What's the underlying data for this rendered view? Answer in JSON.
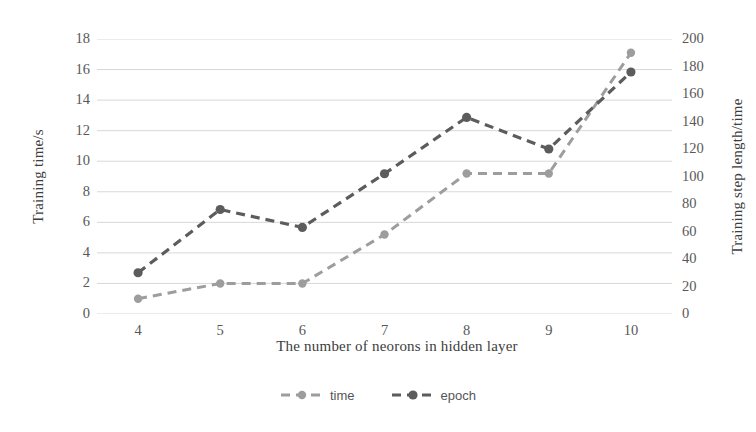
{
  "chart_data": {
    "type": "line",
    "title": "",
    "xlabel": "The number of neorons in hidden layer",
    "ylabel": "Training time/s",
    "ylabel_secondary": "Training step length/time",
    "categories": [
      "4",
      "5",
      "6",
      "7",
      "8",
      "9",
      "10"
    ],
    "x": [
      4,
      5,
      6,
      7,
      8,
      9,
      10
    ],
    "xlim": [
      3.5,
      10.5
    ],
    "ylim": [
      0,
      18
    ],
    "ylim_secondary": [
      0,
      200
    ],
    "yticks": [
      "0",
      "2",
      "4",
      "6",
      "8",
      "10",
      "12",
      "14",
      "16",
      "18"
    ],
    "yticks_secondary": [
      "0",
      "20",
      "40",
      "60",
      "80",
      "100",
      "120",
      "140",
      "160",
      "180",
      "200"
    ],
    "grid": true,
    "grid_axis": "y",
    "legend_position": "bottom-center",
    "series": [
      {
        "name": "time",
        "axis": "left",
        "color": "#9d9d9d",
        "style": "dashed",
        "marker": "circle",
        "values": [
          1.0,
          2.0,
          2.0,
          5.2,
          9.2,
          9.2,
          17.1
        ]
      },
      {
        "name": "epoch",
        "axis": "right",
        "color": "#5c5c5c",
        "style": "dashed",
        "marker": "circle",
        "values": [
          30,
          76,
          63,
          102,
          143,
          120,
          176
        ]
      }
    ]
  },
  "axes": {
    "left": {
      "title": "Training time/s",
      "ticks": [
        "18",
        "16",
        "14",
        "12",
        "10",
        "8",
        "6",
        "4",
        "2",
        "0"
      ]
    },
    "right": {
      "title": "Training step length/time",
      "ticks": [
        "200",
        "180",
        "160",
        "140",
        "120",
        "100",
        "80",
        "60",
        "40",
        "20",
        "0"
      ]
    },
    "bottom": {
      "title": "The number of neorons in hidden layer",
      "ticks": [
        "4",
        "5",
        "6",
        "7",
        "8",
        "9",
        "10"
      ]
    }
  },
  "legend": {
    "items": [
      {
        "label": "time",
        "color": "#9d9d9d"
      },
      {
        "label": "epoch",
        "color": "#5c5c5c"
      }
    ]
  },
  "colors": {
    "background": "#ffffff",
    "grid": "#d8d8d8",
    "axis_line": "#c9c9c9",
    "text": "#555555",
    "series_time": "#9d9d9d",
    "series_epoch": "#5c5c5c"
  }
}
